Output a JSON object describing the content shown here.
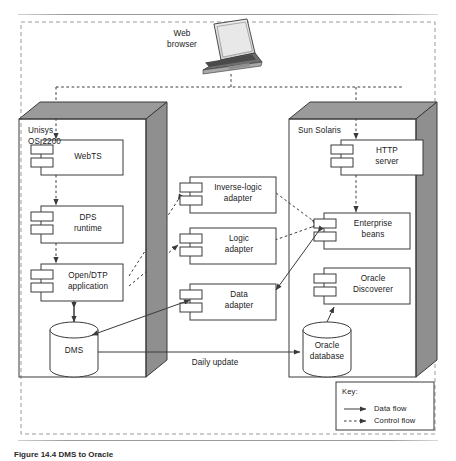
{
  "figure": {
    "caption": "Figure 14.4   DMS to Oracle",
    "client": {
      "label_line1": "Web",
      "label_line2": "browser",
      "icon": "laptop-icon"
    },
    "nodes": [
      {
        "id": "unisys",
        "title_line1": "Unisys",
        "title_line2": "OS 2200"
      },
      {
        "id": "solaris",
        "title_line1": "Sun Solaris",
        "title_line2": ""
      }
    ],
    "components": [
      {
        "id": "webts",
        "line1": "WebTS",
        "line2": ""
      },
      {
        "id": "dps",
        "line1": "DPS",
        "line2": "runtime"
      },
      {
        "id": "opendtp",
        "line1": "Open/DTP",
        "line2": "application"
      },
      {
        "id": "http",
        "line1": "HTTP",
        "line2": "server"
      },
      {
        "id": "inverselogic",
        "line1": "Inverse-logic",
        "line2": "adapter"
      },
      {
        "id": "logic",
        "line1": "Logic",
        "line2": "adapter"
      },
      {
        "id": "data",
        "line1": "Data",
        "line2": "adapter"
      },
      {
        "id": "ejb",
        "line1": "Enterprise",
        "line2": "beans"
      },
      {
        "id": "discoverer",
        "line1": "Oracle",
        "line2": "Discoverer"
      }
    ],
    "datastores": [
      {
        "id": "dms",
        "line1": "DMS",
        "line2": ""
      },
      {
        "id": "oracle",
        "line1": "Oracle",
        "line2": "database"
      }
    ],
    "edge_labels": [
      {
        "id": "daily-update",
        "text": "Daily update"
      }
    ],
    "legend": {
      "title": "Key:",
      "items": [
        {
          "id": "data-flow",
          "label": "Data flow",
          "style": "solid"
        },
        {
          "id": "control-flow",
          "label": "Control flow",
          "style": "dashed"
        }
      ]
    },
    "colors": {
      "line": "#3a3a3a",
      "node_shade": "#9a9a9a",
      "node_shade_dark": "#8a8a8a",
      "fill": "#ffffff",
      "rule": "#9a9a9a"
    }
  }
}
